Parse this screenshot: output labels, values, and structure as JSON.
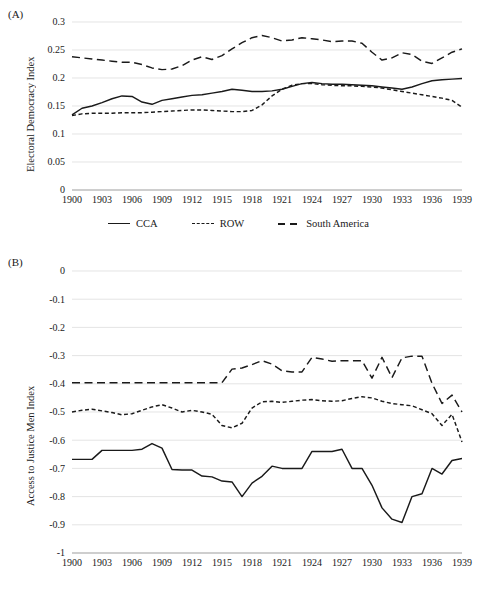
{
  "figure": {
    "panels": [
      {
        "tag": "(A)",
        "ylabel": "Electoral Democracy Index",
        "yticks": [
          "0",
          "0.05",
          "0.1",
          "0.15",
          "0.2",
          "0.25",
          "0.3"
        ]
      },
      {
        "tag": "(B)",
        "ylabel": "Access to Justice Men Index",
        "yticks": [
          "0",
          "-0.1",
          "-0.2",
          "-0.3",
          "-0.4",
          "-0.5",
          "-0.6",
          "-0.7",
          "-0.8",
          "-0.9",
          "-1"
        ]
      }
    ],
    "xticks": [
      "1900",
      "1903",
      "1906",
      "1909",
      "1912",
      "1915",
      "1918",
      "1921",
      "1924",
      "1927",
      "1930",
      "1933",
      "1936",
      "1939"
    ],
    "legend": [
      {
        "label": "CCA",
        "style": "solid"
      },
      {
        "label": "ROW",
        "style": "dash-short"
      },
      {
        "label": "South America",
        "style": "dash-long"
      }
    ]
  },
  "chart_data": [
    {
      "type": "line",
      "title": "(A)",
      "xlabel": "",
      "ylabel": "Electoral Democracy Index",
      "xlim": [
        1900,
        1939
      ],
      "ylim": [
        0,
        0.3
      ],
      "grid": true,
      "legend_position": "bottom",
      "x": [
        1900,
        1901,
        1902,
        1903,
        1904,
        1905,
        1906,
        1907,
        1908,
        1909,
        1910,
        1911,
        1912,
        1913,
        1914,
        1915,
        1916,
        1917,
        1918,
        1919,
        1920,
        1921,
        1922,
        1923,
        1924,
        1925,
        1926,
        1927,
        1928,
        1929,
        1930,
        1931,
        1932,
        1933,
        1934,
        1935,
        1936,
        1937,
        1938,
        1939
      ],
      "series": [
        {
          "name": "CCA",
          "style": "solid",
          "values": [
            0.134,
            0.146,
            0.15,
            0.156,
            0.163,
            0.168,
            0.167,
            0.157,
            0.153,
            0.16,
            0.163,
            0.166,
            0.169,
            0.17,
            0.173,
            0.176,
            0.18,
            0.178,
            0.176,
            0.176,
            0.177,
            0.18,
            0.185,
            0.19,
            0.192,
            0.19,
            0.189,
            0.189,
            0.188,
            0.187,
            0.186,
            0.184,
            0.182,
            0.18,
            0.184,
            0.19,
            0.195,
            0.197,
            0.198,
            0.199
          ]
        },
        {
          "name": "ROW",
          "style": "dash-short",
          "values": [
            0.133,
            0.136,
            0.137,
            0.137,
            0.137,
            0.138,
            0.138,
            0.138,
            0.139,
            0.14,
            0.141,
            0.142,
            0.143,
            0.143,
            0.142,
            0.141,
            0.14,
            0.14,
            0.142,
            0.152,
            0.168,
            0.18,
            0.187,
            0.19,
            0.19,
            0.188,
            0.187,
            0.186,
            0.186,
            0.185,
            0.184,
            0.182,
            0.179,
            0.176,
            0.173,
            0.17,
            0.167,
            0.164,
            0.16,
            0.148
          ]
        },
        {
          "name": "South America",
          "style": "dash-long",
          "values": [
            0.238,
            0.236,
            0.234,
            0.232,
            0.23,
            0.228,
            0.228,
            0.224,
            0.218,
            0.215,
            0.216,
            0.222,
            0.232,
            0.238,
            0.233,
            0.24,
            0.252,
            0.263,
            0.272,
            0.276,
            0.272,
            0.266,
            0.268,
            0.272,
            0.27,
            0.268,
            0.265,
            0.266,
            0.266,
            0.262,
            0.246,
            0.232,
            0.236,
            0.245,
            0.242,
            0.23,
            0.226,
            0.236,
            0.246,
            0.252
          ]
        }
      ]
    },
    {
      "type": "line",
      "title": "(B)",
      "xlabel": "",
      "ylabel": "Access to Justice Men Index",
      "xlim": [
        1900,
        1939
      ],
      "ylim": [
        -1,
        0
      ],
      "grid": true,
      "legend_position": "bottom",
      "x": [
        1900,
        1901,
        1902,
        1903,
        1904,
        1905,
        1906,
        1907,
        1908,
        1909,
        1910,
        1911,
        1912,
        1913,
        1914,
        1915,
        1916,
        1917,
        1918,
        1919,
        1920,
        1921,
        1922,
        1923,
        1924,
        1925,
        1926,
        1927,
        1928,
        1929,
        1930,
        1931,
        1932,
        1933,
        1934,
        1935,
        1936,
        1937,
        1938,
        1939
      ],
      "series": [
        {
          "name": "CCA",
          "style": "solid",
          "values": [
            -0.668,
            -0.668,
            -0.668,
            -0.636,
            -0.636,
            -0.636,
            -0.636,
            -0.632,
            -0.612,
            -0.628,
            -0.704,
            -0.706,
            -0.706,
            -0.727,
            -0.73,
            -0.745,
            -0.748,
            -0.8,
            -0.752,
            -0.728,
            -0.692,
            -0.7,
            -0.7,
            -0.7,
            -0.64,
            -0.64,
            -0.64,
            -0.632,
            -0.7,
            -0.7,
            -0.76,
            -0.84,
            -0.88,
            -0.892,
            -0.8,
            -0.79,
            -0.7,
            -0.72,
            -0.672,
            -0.665
          ]
        },
        {
          "name": "ROW",
          "style": "dash-short",
          "values": [
            -0.5,
            -0.494,
            -0.49,
            -0.496,
            -0.502,
            -0.51,
            -0.506,
            -0.494,
            -0.482,
            -0.474,
            -0.486,
            -0.5,
            -0.494,
            -0.5,
            -0.508,
            -0.548,
            -0.556,
            -0.54,
            -0.486,
            -0.464,
            -0.462,
            -0.466,
            -0.462,
            -0.458,
            -0.456,
            -0.46,
            -0.462,
            -0.46,
            -0.452,
            -0.446,
            -0.45,
            -0.462,
            -0.47,
            -0.474,
            -0.478,
            -0.492,
            -0.506,
            -0.548,
            -0.508,
            -0.606
          ]
        },
        {
          "name": "South America",
          "style": "dash-long",
          "values": [
            -0.396,
            -0.396,
            -0.396,
            -0.396,
            -0.396,
            -0.396,
            -0.396,
            -0.396,
            -0.396,
            -0.396,
            -0.396,
            -0.396,
            -0.396,
            -0.396,
            -0.396,
            -0.396,
            -0.348,
            -0.344,
            -0.332,
            -0.318,
            -0.33,
            -0.354,
            -0.358,
            -0.358,
            -0.306,
            -0.312,
            -0.32,
            -0.318,
            -0.318,
            -0.318,
            -0.38,
            -0.306,
            -0.378,
            -0.308,
            -0.302,
            -0.302,
            -0.398,
            -0.47,
            -0.44,
            -0.5
          ]
        }
      ]
    }
  ]
}
